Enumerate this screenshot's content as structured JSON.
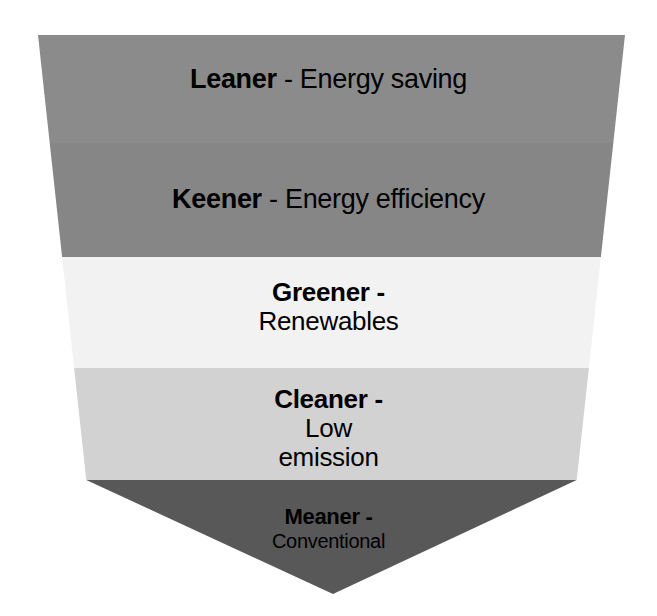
{
  "diagram": {
    "type": "inverted-pyramid",
    "background_color": "#ffffff",
    "text_color": "#000000",
    "geometry": {
      "canvas_width": 657,
      "canvas_height": 616,
      "top_left_x": 38,
      "top_right_x": 625,
      "top_y": 35,
      "apex_x": 333,
      "apex_y": 594,
      "band_boundaries_y": [
        35,
        143,
        257,
        368,
        480,
        594
      ]
    },
    "levels": [
      {
        "rank": 1,
        "name": "Leaner",
        "lead": "Leaner",
        "separator": " - ",
        "description": "Energy saving",
        "lines": [
          "Leaner - Energy saving"
        ],
        "color": "#8b8b8b"
      },
      {
        "rank": 2,
        "name": "Keener",
        "lead": "Keener",
        "separator": " - ",
        "description": "Energy efficiency",
        "lines": [
          "Keener - Energy efficiency"
        ],
        "color": "#868686"
      },
      {
        "rank": 3,
        "name": "Greener",
        "lead": "Greener",
        "separator": " -",
        "description": "Renewables",
        "lines": [
          "Greener -",
          "Renewables"
        ],
        "color": "#f2f2f2"
      },
      {
        "rank": 4,
        "name": "Cleaner",
        "lead": "Cleaner",
        "separator": " -",
        "description": "Low emission",
        "lines": [
          "Cleaner -",
          "Low",
          "emission"
        ],
        "color": "#d2d2d2"
      },
      {
        "rank": 5,
        "name": "Meaner",
        "lead": "Meaner",
        "separator": " -",
        "description": "Conventional",
        "lines": [
          "Meaner -",
          "Conventional"
        ],
        "color": "#585858"
      }
    ]
  }
}
